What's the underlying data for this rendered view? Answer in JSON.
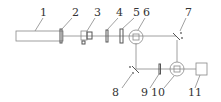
{
  "diagram": {
    "type": "optical-setup-schematic",
    "labels": {
      "l1": "1",
      "l2": "2",
      "l3": "3",
      "l4": "4",
      "l5": "5",
      "l6": "6",
      "l7": "7",
      "l8": "8",
      "l9": "9",
      "l10": "10",
      "l11": "11"
    },
    "components": [
      {
        "id": "1",
        "shape": "long-rectangle (source)"
      },
      {
        "id": "2",
        "shape": "thin plate"
      },
      {
        "id": "3",
        "shape": "mount/holder"
      },
      {
        "id": "4",
        "shape": "thin plate"
      },
      {
        "id": "5",
        "shape": "thin plate"
      },
      {
        "id": "6",
        "shape": "circle with square (beam splitter)"
      },
      {
        "id": "7",
        "shape": "angled mirror"
      },
      {
        "id": "8",
        "shape": "angled mirror"
      },
      {
        "id": "9",
        "shape": "thin plate"
      },
      {
        "id": "10",
        "shape": "circle with square (beam combiner)"
      },
      {
        "id": "11",
        "shape": "square box (detector)"
      }
    ]
  }
}
